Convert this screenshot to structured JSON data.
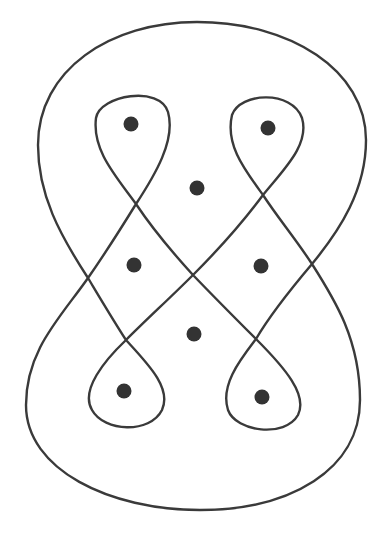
{
  "diagram": {
    "title": "",
    "stroke_color": "#3a3a3a",
    "dot_color": "#333333",
    "crossings": [
      [
        136,
        204
      ],
      [
        263,
        195
      ],
      [
        193,
        275
      ],
      [
        126,
        340
      ],
      [
        256,
        339
      ],
      [
        88,
        278
      ],
      [
        312,
        264
      ]
    ],
    "dots": [
      {
        "id": "top-left-loop",
        "x": 131,
        "y": 124
      },
      {
        "id": "top-right-loop",
        "x": 268,
        "y": 128
      },
      {
        "id": "upper-center",
        "x": 197,
        "y": 188
      },
      {
        "id": "middle-left",
        "x": 134,
        "y": 265
      },
      {
        "id": "middle-right",
        "x": 261,
        "y": 266
      },
      {
        "id": "lower-center",
        "x": 194,
        "y": 334
      },
      {
        "id": "bottom-left-loop",
        "x": 124,
        "y": 391
      },
      {
        "id": "bottom-right-loop",
        "x": 262,
        "y": 397
      }
    ]
  }
}
